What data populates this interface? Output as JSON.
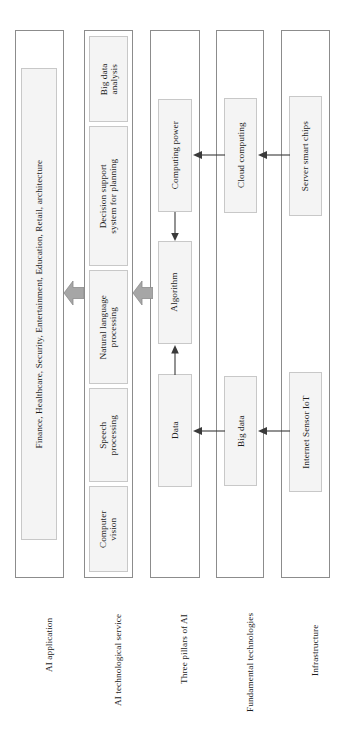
{
  "diagram": {
    "orientation": "rotated-90-ccw",
    "colors": {
      "frame_border": "#8c8c8c",
      "box_border": "#c8c8c8",
      "box_fill": "#f4f4f4",
      "block_arrow_fill": "#a6a6a6",
      "block_arrow_stroke": "#8c8c8c",
      "thin_arrow": "#3a3a3a",
      "text": "#1c1c1c",
      "page_background": "#ffffff"
    }
  },
  "rows": [
    {
      "id": "ai-application",
      "label": "AI application",
      "boxes": [
        {
          "id": "application-domains",
          "text": "Finance, Healthcare, Security, Entertainment, Education, Retail, architecture"
        }
      ]
    },
    {
      "id": "ai-technological-service",
      "label": "AI technological service",
      "boxes": [
        {
          "id": "big-data-analysis",
          "text": "Big data\nanalysis"
        },
        {
          "id": "decision-support-system",
          "text": "Decision support\nsystem for planning"
        },
        {
          "id": "natural-language-processing",
          "text": "Natural language\nprocessing"
        },
        {
          "id": "speech-processing",
          "text": "Speech\nprocessing"
        },
        {
          "id": "computer-vision",
          "text": "Computer\nvision"
        }
      ]
    },
    {
      "id": "three-pillars-of-ai",
      "label": "Three pillars of AI",
      "boxes": [
        {
          "id": "computing-power",
          "text": "Computing power"
        },
        {
          "id": "algorithm",
          "text": "Algorithm"
        },
        {
          "id": "data",
          "text": "Data"
        }
      ]
    },
    {
      "id": "fundamental-technologies",
      "label": "Fundamental technologies",
      "boxes": [
        {
          "id": "cloud-computing",
          "text": "Cloud computing"
        },
        {
          "id": "big-data",
          "text": "Big data"
        }
      ]
    },
    {
      "id": "infrastructure",
      "label": "Infrastructure",
      "boxes": [
        {
          "id": "server-smart-chips",
          "text": "Server smart chips"
        },
        {
          "id": "internet-sensor-iot",
          "text": "Internet Sensor IoT"
        }
      ]
    }
  ],
  "connectors": {
    "block_arrows": [
      {
        "id": "pillars-to-service",
        "from": "three-pillars-of-ai",
        "to": "ai-technological-service"
      },
      {
        "id": "service-to-application",
        "from": "ai-technological-service",
        "to": "ai-application"
      }
    ],
    "thin_arrows": [
      {
        "id": "cloud-to-computing-power",
        "from": "cloud-computing",
        "to": "computing-power"
      },
      {
        "id": "chips-to-cloud",
        "from": "server-smart-chips",
        "to": "cloud-computing"
      },
      {
        "id": "bigdata-to-data",
        "from": "big-data",
        "to": "data"
      },
      {
        "id": "iot-to-bigdata",
        "from": "internet-sensor-iot",
        "to": "big-data"
      },
      {
        "id": "computing-power-to-algorithm",
        "from": "computing-power",
        "to": "algorithm"
      },
      {
        "id": "data-to-algorithm",
        "from": "data",
        "to": "algorithm"
      }
    ]
  }
}
